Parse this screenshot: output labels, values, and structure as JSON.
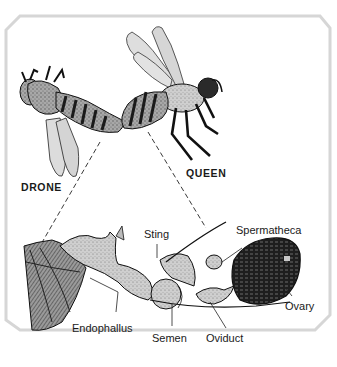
{
  "diagram": {
    "frame": {
      "stroke": "#d6d6d6",
      "fill": "#ffffff"
    },
    "colors": {
      "ink": "#1a1a1a",
      "wing_fill": "#d9d9d9",
      "body_mid": "#8a8a8a",
      "body_dark": "#2a2a2a",
      "organ_light": "#bdbdbd",
      "ovary": "#1e1e1e"
    },
    "figures": [
      {
        "id": "drone",
        "label": "DRONE"
      },
      {
        "id": "queen",
        "label": "QUEEN"
      }
    ],
    "parts": [
      {
        "id": "sting",
        "label": "Sting"
      },
      {
        "id": "spermatheca",
        "label": "Spermatheca"
      },
      {
        "id": "ovary",
        "label": "Ovary"
      },
      {
        "id": "endophallus",
        "label": "Endophallus"
      },
      {
        "id": "semen",
        "label": "Semen"
      },
      {
        "id": "oviduct",
        "label": "Oviduct"
      }
    ]
  }
}
